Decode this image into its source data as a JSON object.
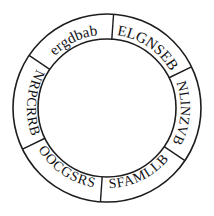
{
  "figure": {
    "kind": "segmented-ring-wheel",
    "background_color": "#ffffff",
    "stroke_color": "#1d1d1f",
    "text_color": "#111114",
    "center_x": 107,
    "center_y": 108,
    "outer_radius": 94,
    "inner_radius": 69,
    "outer_stroke_width": 1.6,
    "inner_stroke_width": 1.6,
    "divider_stroke_width": 1.4,
    "segment_count": 6
  },
  "segments": [
    {
      "id": "segment-elgnseb",
      "label": "ELGNSEB",
      "start_angle": -86,
      "end_angle": -26,
      "mid_angle": -56,
      "font_size": 15,
      "flipped": false,
      "case": "upper"
    },
    {
      "id": "segment-nlinzvb",
      "label": "NLINZVB",
      "start_angle": -26,
      "end_angle": 34,
      "mid_angle": 4,
      "font_size": 14,
      "flipped": false,
      "case": "upper"
    },
    {
      "id": "segment-sfamllb",
      "label": "SFAMLLB",
      "start_angle": 34,
      "end_angle": 94,
      "mid_angle": 64,
      "font_size": 14,
      "flipped": true,
      "case": "upper"
    },
    {
      "id": "segment-oocgsrs",
      "label": "OOCGSRS",
      "start_angle": 94,
      "end_angle": 154,
      "mid_angle": 124,
      "font_size": 14,
      "flipped": true,
      "case": "upper"
    },
    {
      "id": "segment-nrpcrrb",
      "label": "NRPCRRB",
      "start_angle": 154,
      "end_angle": 214,
      "mid_angle": 184,
      "font_size": 14,
      "flipped": true,
      "case": "upper"
    },
    {
      "id": "segment-ergdbab",
      "label": "ergdbab",
      "start_angle": 214,
      "end_angle": 274,
      "mid_angle": 244,
      "font_size": 15,
      "flipped": false,
      "case": "lower"
    }
  ],
  "dividers": [
    {
      "id": "divider-top",
      "angle": -86
    },
    {
      "id": "divider-upper-right",
      "angle": -26
    },
    {
      "id": "divider-lower-right",
      "angle": 34
    },
    {
      "id": "divider-bottom",
      "angle": 94
    },
    {
      "id": "divider-lower-left",
      "angle": 154
    },
    {
      "id": "divider-upper-left",
      "angle": 214
    }
  ]
}
